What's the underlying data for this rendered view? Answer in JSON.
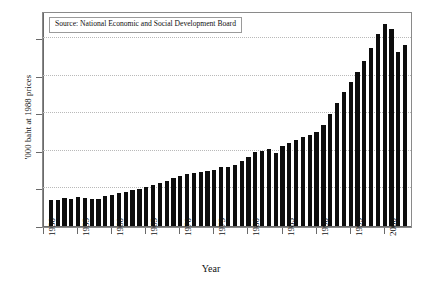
{
  "chart_data": {
    "type": "bar",
    "title": "",
    "xlabel": "Year",
    "ylabel": "'000 baht at 1988 prices",
    "annotation": "Source: National Economic and Social Development Board",
    "grid": true,
    "legend": false,
    "xlim": [
      1950,
      2004
    ],
    "ylim": [
      0,
      57
    ],
    "yticks": [
      0,
      10,
      20,
      30,
      40,
      50
    ],
    "ytick_labels": [
      "0",
      "10",
      "20",
      "30",
      "40",
      "50"
    ],
    "xticks": [
      1950,
      1955,
      1960,
      1965,
      1970,
      1975,
      1980,
      1985,
      1990,
      1995,
      2000
    ],
    "xtick_labels": [
      "1950",
      "1955",
      "1960",
      "1965",
      "1970",
      "1975",
      "1980",
      "1985",
      "1990",
      "1995",
      "2000"
    ],
    "bar_color": "#0d0d0d",
    "categories": [
      1951,
      1952,
      1953,
      1954,
      1955,
      1956,
      1957,
      1958,
      1959,
      1960,
      1961,
      1962,
      1963,
      1964,
      1965,
      1966,
      1967,
      1968,
      1969,
      1970,
      1971,
      1972,
      1973,
      1974,
      1975,
      1976,
      1977,
      1978,
      1979,
      1980,
      1981,
      1982,
      1983,
      1984,
      1985,
      1986,
      1987,
      1988,
      1989,
      1990,
      1991,
      1992,
      1993,
      1994,
      1995,
      1996,
      1997,
      1998,
      1999,
      2000,
      2001,
      2002,
      2003
    ],
    "values": [
      6.9,
      7.0,
      7.4,
      7.1,
      7.7,
      7.5,
      7.2,
      7.3,
      7.9,
      8.3,
      8.7,
      9.1,
      9.5,
      9.9,
      10.3,
      11.0,
      11.5,
      12.0,
      12.8,
      13.3,
      13.8,
      14.0,
      14.3,
      14.6,
      15.0,
      15.6,
      15.7,
      16.3,
      17.2,
      18.4,
      19.7,
      20.1,
      20.4,
      19.4,
      21.2,
      22.1,
      22.8,
      23.6,
      24.2,
      25.1,
      27.0,
      29.9,
      32.8,
      35.7,
      38.4,
      41.0,
      43.9,
      47.4,
      51.1,
      53.8,
      52.4,
      46.4,
      48.1
    ]
  }
}
